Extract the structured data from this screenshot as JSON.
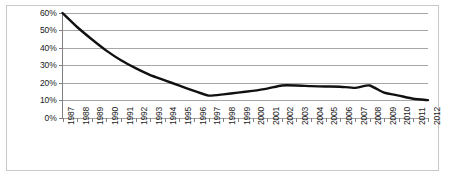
{
  "chart_data": {
    "type": "line",
    "title": "",
    "subtitle": "",
    "xlabel": "",
    "ylabel": "",
    "categories": [
      "1987",
      "1988",
      "1989",
      "1990",
      "1991",
      "1992",
      "1993",
      "1994",
      "1995",
      "1996",
      "1997",
      "1998",
      "1999",
      "2000",
      "2001",
      "2002",
      "2003",
      "2004",
      "2005",
      "2006",
      "2007",
      "2008",
      "2009",
      "2010",
      "2011",
      "2012"
    ],
    "values": [
      60,
      52,
      45,
      38.5,
      33,
      28.5,
      24.5,
      21.5,
      18.5,
      15.5,
      12.8,
      13.5,
      14.5,
      15.5,
      16.8,
      18.6,
      18.6,
      18.2,
      18,
      17.9,
      17.2,
      18.6,
      14.5,
      12.8,
      11,
      10.2
    ],
    "series": [
      {
        "name": "series-1",
        "color": "#111111",
        "values": [
          60,
          52,
          45,
          38.5,
          33,
          28.5,
          24.5,
          21.5,
          18.5,
          15.5,
          12.8,
          13.5,
          14.5,
          15.5,
          16.8,
          18.6,
          18.6,
          18.2,
          18,
          17.9,
          17.2,
          18.6,
          14.5,
          12.8,
          11,
          10.2
        ]
      }
    ],
    "ylim": [
      0,
      60
    ],
    "ytick_values": [
      0,
      10,
      20,
      30,
      40,
      50,
      60
    ],
    "ytick_labels": [
      "0%",
      "10%",
      "20%",
      "30%",
      "40%",
      "50%",
      "60%"
    ],
    "grid": true,
    "grid_axis": "y",
    "grid_color": "#a6a6a6",
    "legend": false,
    "legend_position": "none",
    "line_color": "#111111",
    "line_width": 2.4,
    "markers": false,
    "xtick_rotation": 90,
    "plot_background": "#ffffff",
    "frame_color": "#c9c9c9",
    "axis_color": "#808080"
  }
}
